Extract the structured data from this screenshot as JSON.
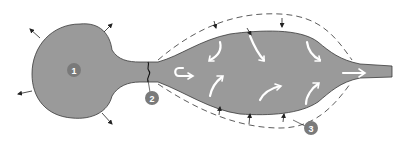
{
  "diagram": {
    "type": "anatomical-flow-schematic",
    "colors": {
      "body_fill": "#9a9a9a",
      "body_stroke": "#3a3a3a",
      "marker_fill": "#7a7a7a",
      "marker_text": "#ffffff",
      "dashed_outline": "#4a4a4a",
      "flow_arrow": "#ffffff",
      "pressure_arrow": "#222222",
      "background": "#ffffff"
    },
    "markers": [
      {
        "id": "1",
        "label": "1",
        "region": "bulb"
      },
      {
        "id": "2",
        "label": "2",
        "region": "neck-constriction"
      },
      {
        "id": "3",
        "label": "3",
        "region": "dashed-outer-boundary"
      }
    ]
  }
}
